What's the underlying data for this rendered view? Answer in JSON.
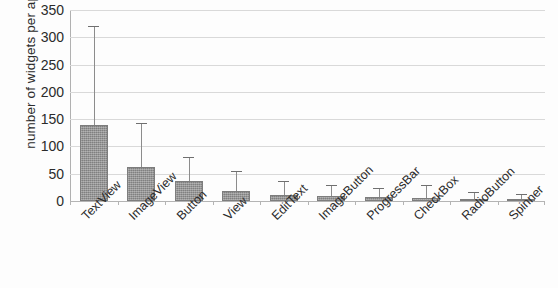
{
  "chart_data": {
    "type": "bar",
    "title": "",
    "subtitle": "",
    "xlabel": "",
    "ylabel": "number of widgets per app",
    "ylim": [
      0,
      350
    ],
    "yticks": [
      0,
      50,
      100,
      150,
      200,
      250,
      300,
      350
    ],
    "ytick_labels": [
      "0",
      "50",
      "100",
      "150",
      "200",
      "250",
      "300",
      "350"
    ],
    "grid": true,
    "legend": "none",
    "error_bars": "upper only (standard deviation)",
    "categories": [
      "TextView",
      "ImageView",
      "Button",
      "View",
      "EditText",
      "ImageButton",
      "ProgressBar",
      "CheckBox",
      "RadioButton",
      "Spinner"
    ],
    "values": [
      140,
      62,
      37,
      18,
      11,
      10,
      7,
      6,
      4,
      3
    ],
    "error_upper": [
      320,
      143,
      81,
      55,
      37,
      30,
      24,
      30,
      17,
      12
    ],
    "series": [
      {
        "name": "number of widgets per app",
        "values": [
          140,
          62,
          37,
          18,
          11,
          10,
          7,
          6,
          4,
          3
        ],
        "color": "#8f8f8f"
      }
    ]
  },
  "colors": {
    "bar_fill": "#8f8f8f",
    "bar_edge": "#7d7d7d",
    "gridline": "#d9d9d9",
    "axis": "#b0b0b0",
    "text": "#2b2b2b",
    "background": "#fdfdfd"
  }
}
